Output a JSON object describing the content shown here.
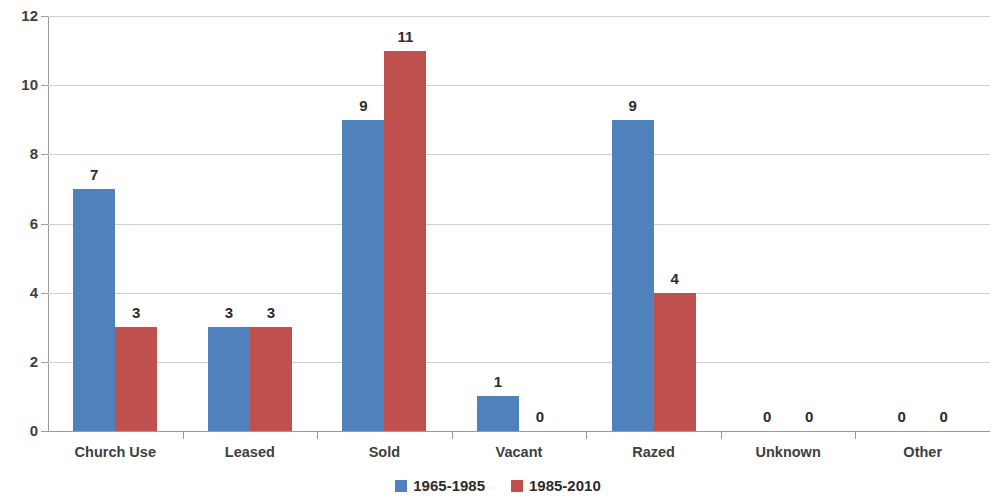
{
  "chart_data": {
    "type": "bar",
    "title": "",
    "subtitle": "",
    "xlabel": "",
    "ylabel": "",
    "ylim": [
      0,
      12
    ],
    "yticks": [
      0,
      2,
      4,
      6,
      8,
      10,
      12
    ],
    "ytick_labels": [
      "0",
      "2",
      "4",
      "6",
      "8",
      "10",
      "12"
    ],
    "grid": true,
    "legend_position": "bottom",
    "categories": [
      "Church Use",
      "Leased",
      "Sold",
      "Vacant",
      "Razed",
      "Unknown",
      "Other"
    ],
    "series": [
      {
        "name": "1965-1985",
        "color": "#4f81bd",
        "values": [
          7,
          3,
          9,
          1,
          9,
          0,
          0
        ],
        "value_labels": [
          "7",
          "3",
          "9",
          "1",
          "9",
          "0",
          "0"
        ]
      },
      {
        "name": "1985-2010",
        "color": "#c0504d",
        "values": [
          3,
          3,
          11,
          0,
          4,
          0,
          0
        ],
        "value_labels": [
          "3",
          "3",
          "11",
          "0",
          "4",
          "0",
          "0"
        ]
      }
    ]
  },
  "legend": {
    "items": [
      {
        "label": "1965-1985",
        "swatch_name": "legend-swatch-1965-1985"
      },
      {
        "label": "1985-2010",
        "swatch_name": "legend-swatch-1985-2010"
      }
    ]
  },
  "colors": {
    "series_1": "#4f81bd",
    "series_2": "#c0504d",
    "gridline": "#d0d0d0",
    "axis": "#9a9a9a",
    "text": "#404040",
    "background": "#ffffff"
  }
}
